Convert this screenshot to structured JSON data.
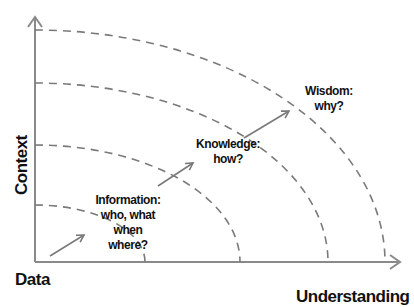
{
  "diagram": {
    "axes": {
      "y_label": "Context",
      "x_origin_label": "Data",
      "x_label": "Understanding"
    },
    "stages": [
      {
        "title": "Information:",
        "lines": [
          "who, what",
          "when",
          "where?"
        ]
      },
      {
        "title": "Knowledge:",
        "lines": [
          "how?"
        ]
      },
      {
        "title": "Wisdom:",
        "lines": [
          "why?"
        ]
      }
    ],
    "arcs_count": 4,
    "colors": {
      "axis": "#8a8a8a",
      "arc": "#7a7a7a",
      "arrow": "#7a7a7a",
      "text": "#111111"
    }
  }
}
